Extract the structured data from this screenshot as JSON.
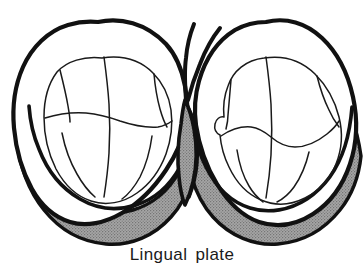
{
  "figure": {
    "title": "Lingual plate",
    "caption": "Lingual plate",
    "background_color": "#ffffff",
    "outline_color": "#111111",
    "fissure_color": "#1a1a1a",
    "plate_fill_color": "#9a9a9a",
    "plate_stipple_color": "#6f6f6f",
    "tooth_fill_color": "#ffffff",
    "parts": [
      {
        "name": "left-tooth",
        "label": "Left molar crown outline",
        "inner_label": "Left molar occlusal table"
      },
      {
        "name": "right-tooth",
        "label": "Right molar crown outline",
        "inner_label": "Right molar occlusal table"
      },
      {
        "name": "lingual-plate",
        "label": "Lingual plate",
        "description": "Shaded band along the lingual border of both crowns, peaking between the teeth"
      }
    ]
  }
}
